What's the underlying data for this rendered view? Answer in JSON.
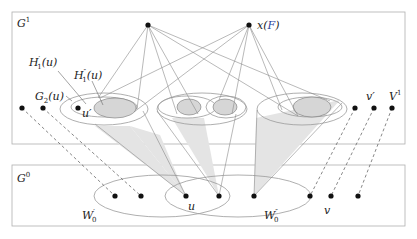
{
  "diagram": {
    "layers": {
      "upper": {
        "label": "G",
        "sup": "1"
      },
      "lower": {
        "label": "G",
        "sup": "0"
      }
    },
    "labels": {
      "H1prime": {
        "base": "H",
        "sup": "′",
        "sub": "1",
        "arg": "(u)"
      },
      "H1dprime": {
        "base": "H",
        "sup": "″",
        "sub": "1",
        "arg": "(u)"
      },
      "G2u": {
        "base": "G",
        "sub": "2",
        "arg": "(u)"
      },
      "uprime": "u′",
      "xF_x": "x(",
      "xF_F": "F",
      "xF_close": ")",
      "vprime": "v′",
      "V1": {
        "base": "V",
        "sup": "1"
      },
      "u": "u",
      "v": "v",
      "W0prime": {
        "base": "W",
        "sup": "′",
        "sub": "0"
      },
      "W0dprime": {
        "base": "W",
        "sup": "″",
        "sub": "0"
      }
    },
    "colors": {
      "line": "#888888",
      "frame": "#aaaaaa",
      "shade": "#d8d8d8",
      "shade_light": "#e8e8e8",
      "vertex": "#111111",
      "accent_F": "#2b3f9a"
    }
  }
}
